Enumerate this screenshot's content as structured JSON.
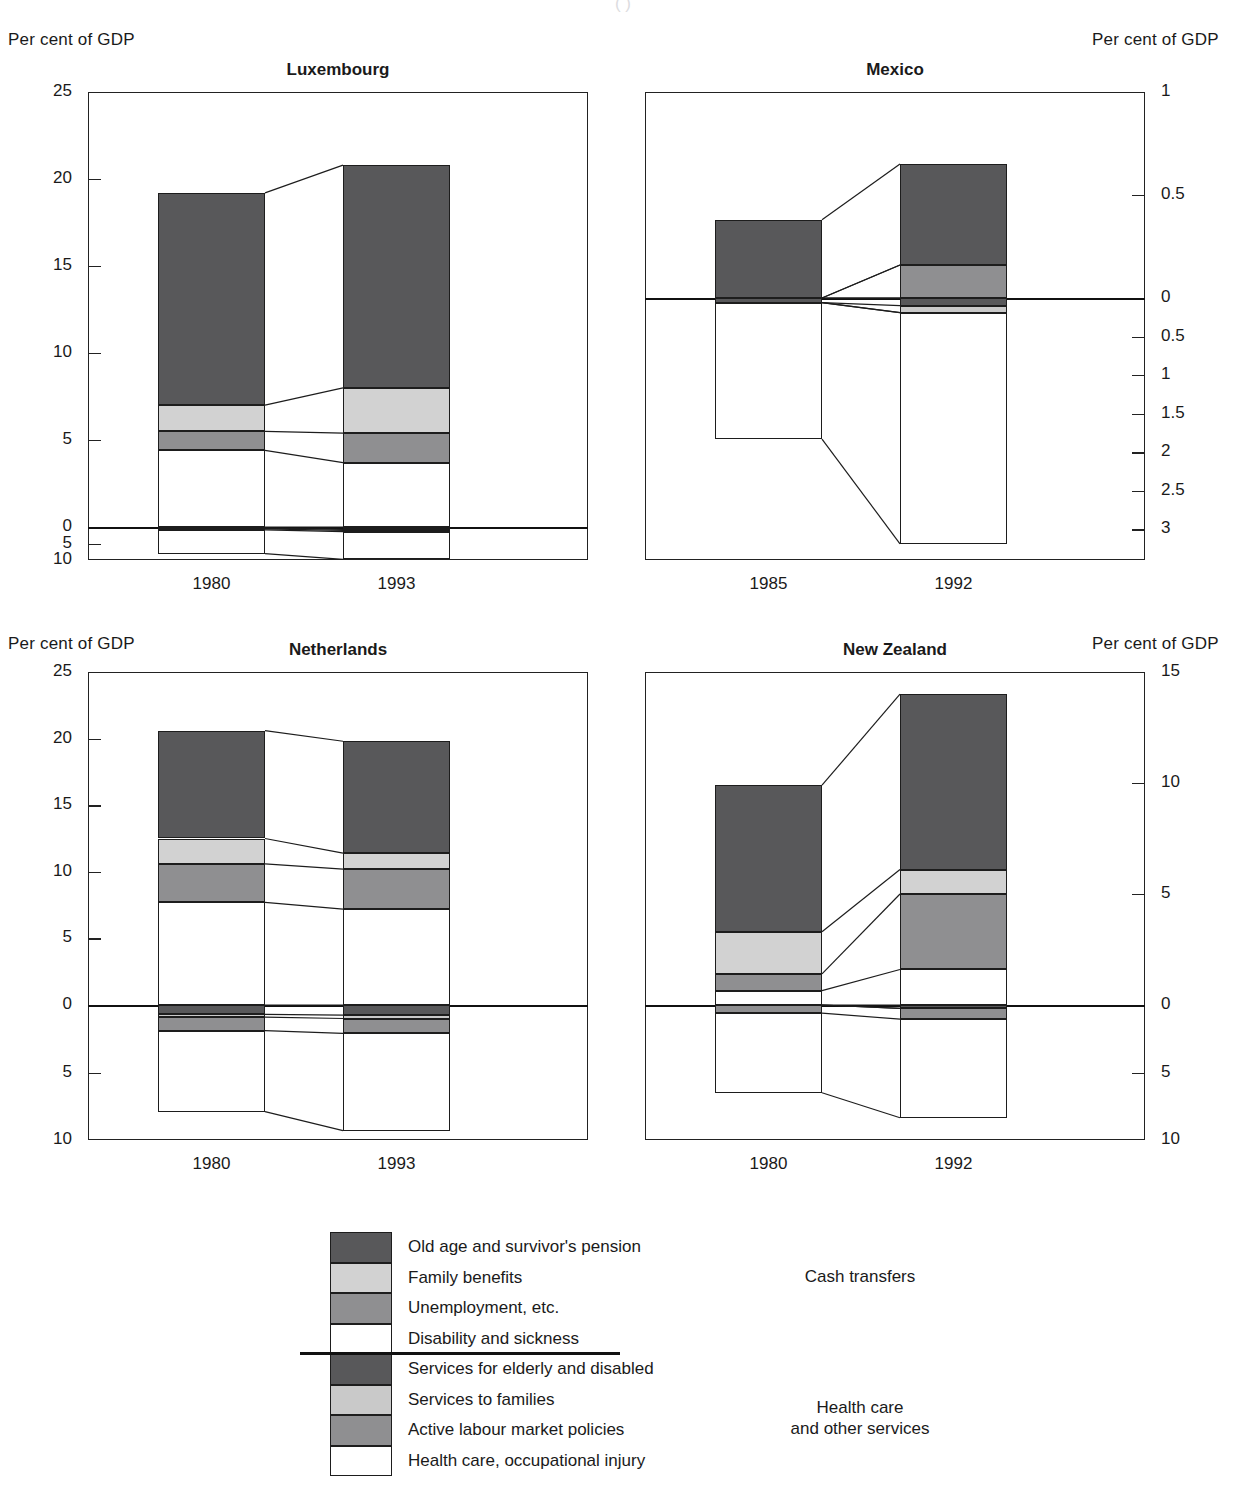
{
  "header": {
    "left_axis_title_top": "Per cent of GDP",
    "right_axis_title_top": "Per cent of GDP",
    "left_axis_title_bottom": "Per cent of GDP",
    "right_axis_title_bottom": "Per cent of GDP",
    "clipped_subtitle": "( )"
  },
  "legend": {
    "items": [
      {
        "label": "Old age and survivor's pension",
        "color": "#58585a"
      },
      {
        "label": "Family benefits",
        "color": "#d2d2d2"
      },
      {
        "label": "Unemployment, etc.",
        "color": "#8f8f91"
      },
      {
        "label": "Disability and sickness",
        "color": "#ffffff"
      },
      {
        "label": "Services for elderly and disabled",
        "color": "#58585a"
      },
      {
        "label": "Services to families",
        "color": "#c9c9c9"
      },
      {
        "label": "Active labour market policies",
        "color": "#8f8f91"
      },
      {
        "label": "Health care, occupational injury",
        "color": "#ffffff"
      }
    ],
    "group_top": "Cash transfers",
    "group_bottom": "Health care\nand other services"
  },
  "chart_data": [
    {
      "type": "bar",
      "title": "Luxembourg",
      "xlabel": "",
      "ylabel": "Per cent of GDP",
      "categories": [
        "1980",
        "1993"
      ],
      "yticks_above": [
        "25",
        "20",
        "15",
        "10",
        "5",
        "0"
      ],
      "yticks_below": [
        "5",
        "10"
      ],
      "ylim": [
        -10,
        25
      ],
      "grid": false,
      "series": [
        {
          "name": "Old age and survivor's pension",
          "side": "above",
          "values": [
            12.2,
            12.8
          ]
        },
        {
          "name": "Family benefits",
          "side": "above",
          "values": [
            1.5,
            2.6
          ]
        },
        {
          "name": "Unemployment, etc.",
          "side": "above",
          "values": [
            1.1,
            1.7
          ]
        },
        {
          "name": "Disability and sickness",
          "side": "above",
          "values": [
            4.4,
            3.7
          ]
        },
        {
          "name": "Services for elderly and disabled",
          "side": "below",
          "values": [
            0.35,
            0.7
          ]
        },
        {
          "name": "Services to families",
          "side": "below",
          "values": [
            0.2,
            0.35
          ]
        },
        {
          "name": "Active labour market policies",
          "side": "below",
          "values": [
            0.3,
            0.35
          ]
        },
        {
          "name": "Health care, occupational injury",
          "side": "below",
          "values": [
            7.2,
            8.4
          ]
        }
      ]
    },
    {
      "type": "bar",
      "title": "Mexico",
      "xlabel": "",
      "ylabel": "Per cent of GDP",
      "categories": [
        "1985",
        "1992"
      ],
      "yticks_above": [
        "1",
        "0.5",
        "0"
      ],
      "yticks_below": [
        "0.5",
        "1",
        "1.5",
        "2",
        "2.5",
        "3"
      ],
      "ylim": [
        -3.4,
        1.0
      ],
      "grid": false,
      "series": [
        {
          "name": "Old age and survivor's pension",
          "side": "above",
          "values": [
            0.38,
            0.49
          ]
        },
        {
          "name": "Family benefits",
          "side": "above",
          "values": [
            0.0,
            0.0
          ]
        },
        {
          "name": "Unemployment, etc.",
          "side": "above",
          "values": [
            0.0,
            0.16
          ]
        },
        {
          "name": "Disability and sickness",
          "side": "above",
          "values": [
            0.0,
            0.0
          ]
        },
        {
          "name": "Services for elderly and disabled",
          "side": "below",
          "values": [
            0.06,
            0.1
          ]
        },
        {
          "name": "Services to families",
          "side": "below",
          "values": [
            0.0,
            0.09
          ]
        },
        {
          "name": "Active labour market policies",
          "side": "below",
          "values": [
            0.0,
            0.0
          ]
        },
        {
          "name": "Health care, occupational injury",
          "side": "below",
          "values": [
            1.77,
            3.0
          ]
        }
      ]
    },
    {
      "type": "bar",
      "title": "Netherlands",
      "xlabel": "",
      "ylabel": "Per cent of GDP",
      "categories": [
        "1980",
        "1993"
      ],
      "yticks_above": [
        "25",
        "20",
        "15",
        "10",
        "5",
        "0"
      ],
      "yticks_below": [
        "5",
        "10"
      ],
      "ylim": [
        -10,
        25
      ],
      "grid": false,
      "series": [
        {
          "name": "Old age and survivor's pension",
          "side": "above",
          "values": [
            8.1,
            8.4
          ]
        },
        {
          "name": "Family benefits",
          "side": "above",
          "values": [
            1.9,
            1.2
          ]
        },
        {
          "name": "Unemployment, etc.",
          "side": "above",
          "values": [
            2.9,
            3.0
          ]
        },
        {
          "name": "Disability and sickness",
          "side": "above",
          "values": [
            7.7,
            7.2
          ]
        },
        {
          "name": "Services for elderly and disabled",
          "side": "below",
          "values": [
            0.7,
            0.75
          ]
        },
        {
          "name": "Services to families",
          "side": "below",
          "values": [
            0.2,
            0.25
          ]
        },
        {
          "name": "Active labour market policies",
          "side": "below",
          "values": [
            1.0,
            1.1
          ]
        },
        {
          "name": "Health care, occupational injury",
          "side": "below",
          "values": [
            6.0,
            7.2
          ]
        }
      ]
    },
    {
      "type": "bar",
      "title": "New Zealand",
      "xlabel": "",
      "ylabel": "Per cent of GDP",
      "categories": [
        "1980",
        "1992"
      ],
      "yticks_above": [
        "15",
        "10",
        "5",
        "0"
      ],
      "yticks_below": [
        "5",
        "10"
      ],
      "ylim": [
        -10,
        15
      ],
      "grid": false,
      "series": [
        {
          "name": "Old age and survivor's pension",
          "side": "above",
          "values": [
            6.6,
            7.9
          ]
        },
        {
          "name": "Family benefits",
          "side": "above",
          "values": [
            1.9,
            1.1
          ]
        },
        {
          "name": "Unemployment, etc.",
          "side": "above",
          "values": [
            0.75,
            3.4
          ]
        },
        {
          "name": "Disability and sickness",
          "side": "above",
          "values": [
            0.65,
            1.6
          ]
        },
        {
          "name": "Services for elderly and disabled",
          "side": "below",
          "values": [
            0.0,
            0.25
          ]
        },
        {
          "name": "Services to families",
          "side": "below",
          "values": [
            0.0,
            0.0
          ]
        },
        {
          "name": "Active labour market policies",
          "side": "below",
          "values": [
            0.6,
            0.8
          ]
        },
        {
          "name": "Health care, occupational injury",
          "side": "below",
          "values": [
            5.9,
            7.3
          ]
        }
      ]
    }
  ]
}
